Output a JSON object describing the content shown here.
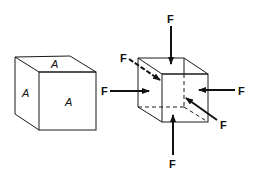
{
  "diagram": {
    "left_cube": {
      "face_labels": {
        "top": "A",
        "side": "A",
        "front": "A"
      }
    },
    "right_cube": {
      "force_labels": {
        "top": "F",
        "back_diagonal": "F",
        "left": "F",
        "right": "F",
        "front_diagonal": "F",
        "bottom": "F"
      }
    },
    "colors": {
      "line": "#1a1a1a",
      "background": "#ffffff"
    }
  }
}
